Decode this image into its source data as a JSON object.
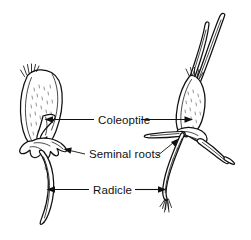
{
  "figure": {
    "background_color": "#ffffff",
    "ink_color": "#111111",
    "labels": [
      {
        "id": "coleoptile",
        "text": "Coleoptile"
      },
      {
        "id": "seminal_roots",
        "text": "Seminal roots"
      },
      {
        "id": "radicle",
        "text": "Radicle"
      }
    ],
    "specimens": [
      {
        "id": "left-seedling",
        "name": "Early germination stage seedling"
      },
      {
        "id": "right-seedling",
        "name": "Later germination stage seedling"
      }
    ]
  }
}
